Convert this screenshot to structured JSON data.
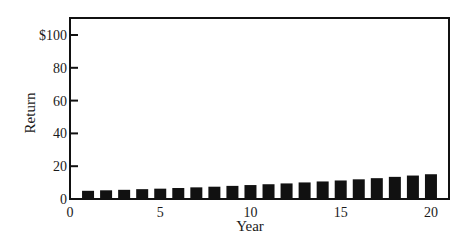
{
  "chart_data": {
    "type": "bar",
    "title": "",
    "xlabel": "Year",
    "ylabel": "Return",
    "categories": [
      1,
      2,
      3,
      4,
      5,
      6,
      7,
      8,
      9,
      10,
      11,
      12,
      13,
      14,
      15,
      16,
      17,
      18,
      19,
      20
    ],
    "values": [
      5.0,
      5.3,
      5.6,
      6.0,
      6.3,
      6.7,
      7.1,
      7.5,
      8.0,
      8.5,
      9.0,
      9.5,
      10.1,
      10.7,
      11.3,
      12.0,
      12.7,
      13.5,
      14.3,
      15.1
    ],
    "ylim": [
      0,
      110
    ],
    "xlim": [
      0,
      21
    ],
    "yticks": [
      0,
      20,
      40,
      60,
      80,
      100
    ],
    "ytick_labels": [
      "0",
      "20",
      "40",
      "60",
      "80",
      "$100"
    ],
    "xticks": [
      0,
      5,
      10,
      15,
      20
    ],
    "xtick_labels": [
      "0",
      "5",
      "10",
      "15",
      "20"
    ],
    "grid": false,
    "legend": null,
    "bar_color": "#111111",
    "frame": "box"
  }
}
